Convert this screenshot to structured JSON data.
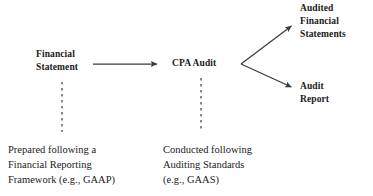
{
  "diagram": {
    "background_color": "#ffffff",
    "line_color": "#3a3a3a",
    "text_color": "#1a1a1a",
    "nodes": {
      "source": {
        "lines": [
          "Financial",
          "Statement"
        ],
        "line1": "Financial",
        "line2": "Statement"
      },
      "process": {
        "lines": [
          "CPA Audit"
        ],
        "line1": "CPA Audit"
      },
      "output_statements": {
        "lines": [
          "Audited",
          "Financial",
          "Statements"
        ],
        "line1": "Audited",
        "line2": "Financial",
        "line3": "Statements"
      },
      "output_report": {
        "lines": [
          "Audit",
          "Report"
        ],
        "line1": "Audit",
        "line2": "Report"
      }
    },
    "captions": {
      "source_note": {
        "lines": [
          "Prepared following a",
          "Financial Reporting",
          "Framework (e.g., GAAP)"
        ],
        "line1": "Prepared following a",
        "line2": "Financial Reporting",
        "line3": "Framework (e.g., GAAP)"
      },
      "process_note": {
        "lines": [
          "Conducted following",
          "Auditing Standards",
          "(e.g., GAAS)"
        ],
        "line1": "Conducted following",
        "line2": "Auditing Standards",
        "line3": "(e.g., GAAS)"
      }
    },
    "connectors": [
      {
        "name": "statement-to-audit-arrow",
        "style": "solid",
        "from": [
          93,
          64
        ],
        "to": [
          160,
          64
        ]
      },
      {
        "name": "audit-to-statements-arrow",
        "style": "solid",
        "from": [
          241,
          64
        ],
        "to": [
          294,
          24
        ]
      },
      {
        "name": "audit-to-report-arrow",
        "style": "solid",
        "from": [
          241,
          64
        ],
        "to": [
          294,
          89
        ]
      },
      {
        "name": "statement-dashed-dropper",
        "style": "dashed",
        "from": [
          62,
          82
        ],
        "to": [
          62,
          132
        ]
      },
      {
        "name": "audit-dashed-dropper",
        "style": "dashed",
        "from": [
          201,
          78
        ],
        "to": [
          201,
          132
        ]
      }
    ]
  }
}
